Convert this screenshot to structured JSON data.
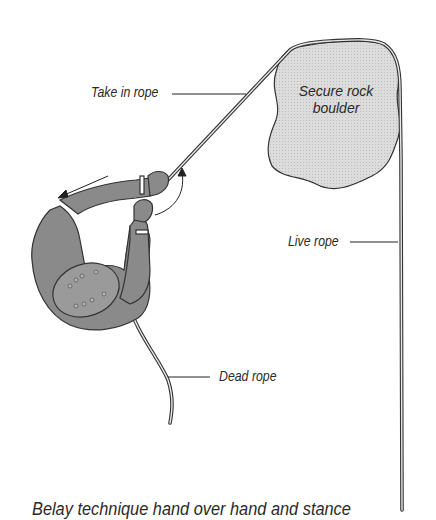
{
  "diagram": {
    "caption": "Belay technique hand over hand and stance",
    "labels": {
      "take_in_rope": "Take in rope",
      "boulder_line1": "Secure rock",
      "boulder_line2": "boulder",
      "live_rope": "Live rope",
      "dead_rope": "Dead rope"
    },
    "colors": {
      "figure_fill": "#8a8a8a",
      "boulder_fill": "#d9d9d9",
      "rope": "#3a3a3a",
      "text": "#2a2a2a"
    }
  }
}
